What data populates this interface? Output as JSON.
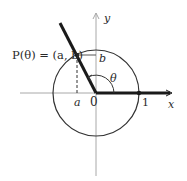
{
  "figure": {
    "labels": {
      "point": "P(θ) = (a, b)",
      "b": "b",
      "a": "a",
      "theta": "θ",
      "origin": "0",
      "one": "1",
      "x_axis": "x",
      "y_axis": "y"
    },
    "colors": {
      "ink": "#1a1a1a",
      "axis": "#9a9a9a",
      "circle": "#333333"
    },
    "angle_degrees": 116,
    "unit_radius": 1
  }
}
